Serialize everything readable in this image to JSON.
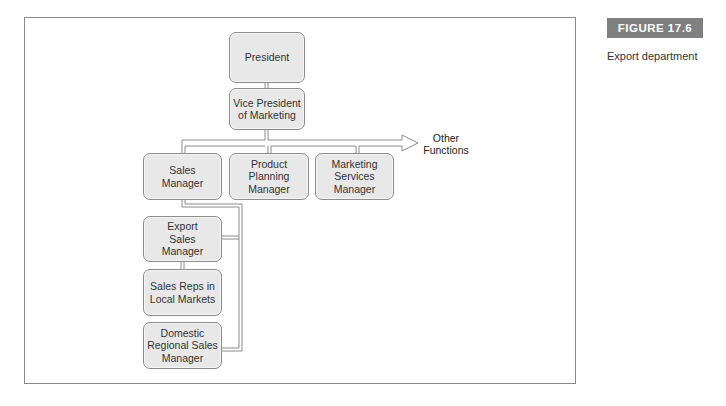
{
  "figure": {
    "label": "FIGURE 17.6",
    "caption": "Export department"
  },
  "chart": {
    "nodes": {
      "president": "President",
      "vp_marketing": "Vice President of Marketing",
      "sales_manager": "Sales Manager",
      "product_planning": "Product Planning Manager",
      "marketing_services": "Marketing Services Manager",
      "export_sales": "Export Sales Manager",
      "sales_reps": "Sales Reps in Local Markets",
      "domestic_regional": "Domestic Regional Sales Manager"
    },
    "other_functions": "Other Functions"
  },
  "colors": {
    "node_fill": "#e8e8e8",
    "node_border": "#8c8c8c",
    "label_bg": "#808080",
    "frame_border": "#8a8a8a"
  }
}
